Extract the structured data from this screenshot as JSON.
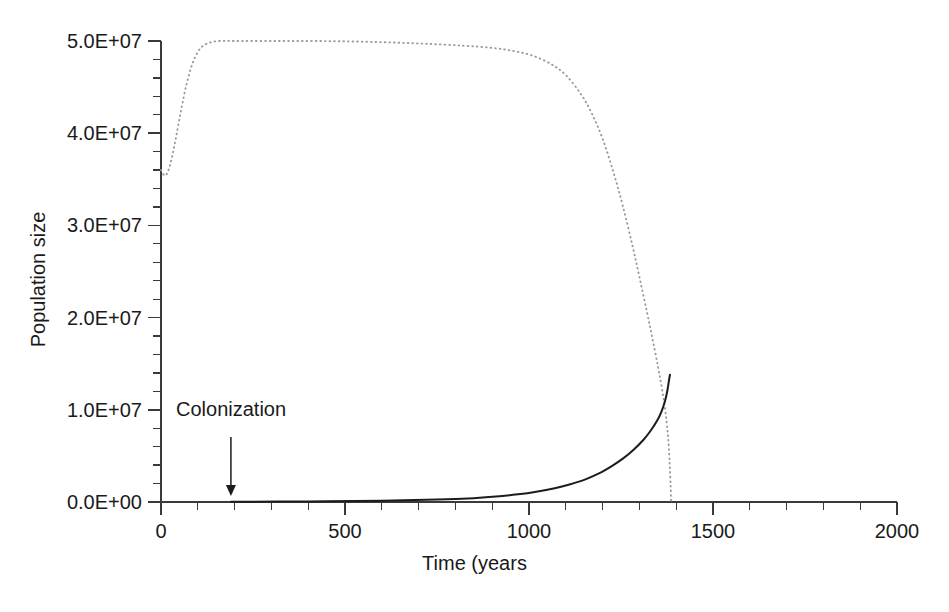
{
  "chart_data": {
    "type": "line",
    "title": "",
    "xlabel": "Time (years",
    "ylabel": "Population size",
    "xlim": [
      0,
      2000
    ],
    "ylim": [
      0,
      50000000
    ],
    "grid": false,
    "legend": "none",
    "x_ticks": [
      0,
      500,
      1000,
      1500,
      2000
    ],
    "x_tick_labels": [
      "0",
      "500",
      "1000",
      "1500",
      "2000"
    ],
    "x_minor_interval": 100,
    "y_ticks": [
      0,
      10000000,
      20000000,
      30000000,
      40000000,
      50000000
    ],
    "y_tick_labels": [
      "0.0E+00",
      "1.0E+07",
      "2.0E+07",
      "3.0E+07",
      "4.0E+07",
      "5.0E+07"
    ],
    "y_minor_count_between_majors": 4,
    "annotations": [
      {
        "text": "Colonization",
        "x": 190,
        "y": 0,
        "label_x": 55,
        "label_y": 11000000,
        "arrow": "down-arrow"
      }
    ],
    "series": [
      {
        "name": "prey-population",
        "style": "dotted",
        "color": "#9a9a9a",
        "points": [
          [
            0,
            36000000
          ],
          [
            12,
            35400000
          ],
          [
            25,
            36600000
          ],
          [
            40,
            39400000
          ],
          [
            55,
            42600000
          ],
          [
            70,
            45400000
          ],
          [
            85,
            47500000
          ],
          [
            100,
            48800000
          ],
          [
            115,
            49500000
          ],
          [
            135,
            49850000
          ],
          [
            160,
            50000000
          ],
          [
            220,
            50000000
          ],
          [
            320,
            50000000
          ],
          [
            420,
            50000000
          ],
          [
            520,
            49950000
          ],
          [
            620,
            49850000
          ],
          [
            720,
            49700000
          ],
          [
            820,
            49500000
          ],
          [
            900,
            49250000
          ],
          [
            960,
            48900000
          ],
          [
            1010,
            48400000
          ],
          [
            1060,
            47500000
          ],
          [
            1100,
            46300000
          ],
          [
            1140,
            44300000
          ],
          [
            1170,
            42200000
          ],
          [
            1200,
            39400000
          ],
          [
            1230,
            35700000
          ],
          [
            1255,
            32100000
          ],
          [
            1280,
            28000000
          ],
          [
            1300,
            24400000
          ],
          [
            1320,
            20700000
          ],
          [
            1335,
            17800000
          ],
          [
            1350,
            14800000
          ],
          [
            1360,
            12600000
          ],
          [
            1368,
            10600000
          ],
          [
            1374,
            8700000
          ],
          [
            1378,
            7000000
          ],
          [
            1381,
            5200000
          ],
          [
            1383,
            3500000
          ],
          [
            1385,
            1600000
          ],
          [
            1386,
            0
          ]
        ]
      },
      {
        "name": "colonizer-population",
        "style": "solid",
        "color": "#1c1c1c",
        "points": [
          [
            190,
            20000
          ],
          [
            400,
            60000
          ],
          [
            600,
            140000
          ],
          [
            750,
            260000
          ],
          [
            850,
            420000
          ],
          [
            920,
            620000
          ],
          [
            970,
            830000
          ],
          [
            1020,
            1120000
          ],
          [
            1070,
            1500000
          ],
          [
            1110,
            1900000
          ],
          [
            1150,
            2400000
          ],
          [
            1190,
            3100000
          ],
          [
            1225,
            3900000
          ],
          [
            1255,
            4700000
          ],
          [
            1285,
            5700000
          ],
          [
            1310,
            6700000
          ],
          [
            1330,
            7700000
          ],
          [
            1348,
            8800000
          ],
          [
            1360,
            9800000
          ],
          [
            1370,
            11000000
          ],
          [
            1376,
            12100000
          ],
          [
            1380,
            13100000
          ],
          [
            1383,
            13800000
          ]
        ]
      }
    ]
  },
  "axes": {
    "y_title": "Population size",
    "x_title": "Time (years"
  },
  "annotation": {
    "colonization_label": "Colonization"
  }
}
